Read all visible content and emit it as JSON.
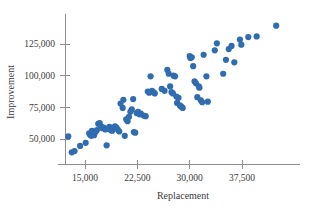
{
  "chart_data": {
    "type": "scatter",
    "title": "",
    "xlabel": "Replacement",
    "ylabel": "Improvement",
    "xlim": [
      11000,
      43500
    ],
    "ylim": [
      33000,
      143000
    ],
    "xticks": [
      15000,
      22500,
      30000,
      37500
    ],
    "xtick_labels": [
      "15,000",
      "22,500",
      "30,000",
      "37,500"
    ],
    "yticks": [
      50000,
      75000,
      100000,
      125000
    ],
    "ytick_labels": [
      "50,000",
      "75,000",
      "100,000",
      "125,000"
    ],
    "grid": false,
    "legend": false,
    "marker_color": "#2f6cb0",
    "marker_size": 3.1,
    "series": [
      {
        "name": "observations",
        "points": [
          [
            12600,
            52000
          ],
          [
            13100,
            39500
          ],
          [
            13500,
            40500
          ],
          [
            14300,
            44500
          ],
          [
            15100,
            47000
          ],
          [
            15600,
            54500
          ],
          [
            15700,
            53500
          ],
          [
            15900,
            52500
          ],
          [
            16000,
            56500
          ],
          [
            16100,
            55000
          ],
          [
            16300,
            53000
          ],
          [
            16500,
            55500
          ],
          [
            16700,
            57000
          ],
          [
            16900,
            62000
          ],
          [
            17100,
            62500
          ],
          [
            17300,
            60000
          ],
          [
            17500,
            58500
          ],
          [
            17700,
            59000
          ],
          [
            17900,
            57500
          ],
          [
            18100,
            45000
          ],
          [
            18300,
            58000
          ],
          [
            18500,
            59500
          ],
          [
            18700,
            57000
          ],
          [
            18900,
            56500
          ],
          [
            19100,
            58500
          ],
          [
            19300,
            60000
          ],
          [
            19500,
            59000
          ],
          [
            19700,
            57500
          ],
          [
            19900,
            56000
          ],
          [
            20100,
            78000
          ],
          [
            20400,
            74500
          ],
          [
            20500,
            81000
          ],
          [
            20700,
            52500
          ],
          [
            20900,
            65500
          ],
          [
            21100,
            64000
          ],
          [
            21300,
            67500
          ],
          [
            21500,
            71500
          ],
          [
            21700,
            73500
          ],
          [
            21900,
            81500
          ],
          [
            22000,
            55500
          ],
          [
            22200,
            55000
          ],
          [
            22400,
            70500
          ],
          [
            22600,
            71500
          ],
          [
            22800,
            69500
          ],
          [
            23000,
            70000
          ],
          [
            23400,
            68500
          ],
          [
            23700,
            68000
          ],
          [
            24000,
            87500
          ],
          [
            24200,
            86500
          ],
          [
            24400,
            99500
          ],
          [
            24600,
            88000
          ],
          [
            24800,
            87000
          ],
          [
            25000,
            86000
          ],
          [
            26000,
            89500
          ],
          [
            26400,
            88000
          ],
          [
            26800,
            104500
          ],
          [
            27000,
            101500
          ],
          [
            27200,
            91500
          ],
          [
            27400,
            87000
          ],
          [
            27600,
            86000
          ],
          [
            27700,
            100000
          ],
          [
            27900,
            99500
          ],
          [
            28100,
            83500
          ],
          [
            28200,
            78500
          ],
          [
            28400,
            82500
          ],
          [
            28600,
            76500
          ],
          [
            28800,
            75500
          ],
          [
            29000,
            74500
          ],
          [
            30000,
            115500
          ],
          [
            30100,
            114000
          ],
          [
            30300,
            114500
          ],
          [
            30500,
            107500
          ],
          [
            30700,
            95500
          ],
          [
            30900,
            94000
          ],
          [
            31100,
            83000
          ],
          [
            31300,
            91500
          ],
          [
            31400,
            90500
          ],
          [
            31600,
            80500
          ],
          [
            31800,
            79000
          ],
          [
            32000,
            116500
          ],
          [
            32400,
            99500
          ],
          [
            32600,
            79500
          ],
          [
            33600,
            120000
          ],
          [
            33900,
            125500
          ],
          [
            34800,
            101500
          ],
          [
            35200,
            112500
          ],
          [
            35600,
            121000
          ],
          [
            36000,
            123500
          ],
          [
            36400,
            110500
          ],
          [
            37200,
            128500
          ],
          [
            37400,
            124500
          ],
          [
            38400,
            130500
          ],
          [
            39600,
            131000
          ],
          [
            42400,
            139500
          ]
        ]
      }
    ]
  }
}
